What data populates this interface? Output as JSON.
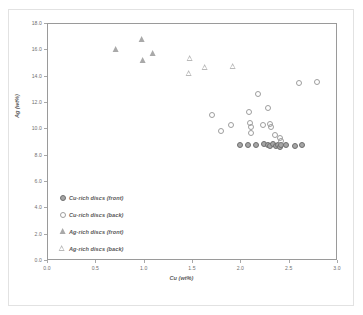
{
  "chart_data": {
    "type": "scatter",
    "title": "",
    "xlabel": "Cu (wt%)",
    "ylabel": "Ag (wt%)",
    "xlim": [
      0.0,
      3.0
    ],
    "ylim": [
      0.0,
      18.0
    ],
    "xticks": [
      "0.0",
      "0.5",
      "1.0",
      "1.5",
      "2.0",
      "2.5",
      "3.0"
    ],
    "yticks": [
      "0.0",
      "2.0",
      "4.0",
      "6.0",
      "8.0",
      "10.0",
      "12.0",
      "14.0",
      "16.0",
      "18.0"
    ],
    "grid": false,
    "legend_position": "inside-lower-left",
    "marker_color_filled": "#a6a6a6",
    "marker_color_outline": "#6e6e6e",
    "marker_color_open": "#9e9e9e",
    "series": [
      {
        "name": "Cu-rich discs (front)",
        "marker": "filled-circle",
        "points": [
          [
            1.99,
            8.83
          ],
          [
            2.07,
            8.83
          ],
          [
            2.15,
            8.83
          ],
          [
            2.23,
            8.87
          ],
          [
            2.28,
            8.83
          ],
          [
            2.3,
            8.7
          ],
          [
            2.33,
            8.87
          ],
          [
            2.36,
            8.72
          ],
          [
            2.38,
            8.83
          ],
          [
            2.4,
            8.65
          ],
          [
            2.41,
            8.8
          ],
          [
            2.46,
            8.78
          ],
          [
            2.55,
            8.7
          ],
          [
            2.63,
            8.83
          ]
        ]
      },
      {
        "name": "Cu-rich discs (back)",
        "marker": "open-circle",
        "points": [
          [
            1.7,
            11.1
          ],
          [
            1.79,
            9.85
          ],
          [
            1.89,
            10.35
          ],
          [
            2.08,
            11.35
          ],
          [
            2.09,
            10.45
          ],
          [
            2.1,
            10.2
          ],
          [
            2.1,
            9.75
          ],
          [
            2.17,
            12.7
          ],
          [
            2.22,
            10.35
          ],
          [
            2.28,
            11.6
          ],
          [
            2.3,
            10.4
          ],
          [
            2.31,
            10.2
          ],
          [
            2.35,
            9.55
          ],
          [
            2.4,
            9.35
          ],
          [
            2.41,
            9.15
          ],
          [
            2.6,
            13.5
          ],
          [
            2.78,
            13.6
          ]
        ]
      },
      {
        "name": "Ag-rich discs (front)",
        "marker": "filled-triangle",
        "points": [
          [
            0.7,
            16.05
          ],
          [
            0.97,
            16.75
          ],
          [
            0.98,
            15.2
          ],
          [
            1.09,
            15.7
          ]
        ]
      },
      {
        "name": "Ag-rich discs (back)",
        "marker": "open-triangle",
        "points": [
          [
            1.47,
            15.35
          ],
          [
            1.46,
            14.2
          ],
          [
            1.63,
            14.65
          ],
          [
            1.92,
            14.75
          ]
        ]
      }
    ]
  },
  "legend": {
    "items": [
      {
        "label": "Cu-rich discs (front)",
        "marker": "filled-circle"
      },
      {
        "label": "Cu-rich discs (back)",
        "marker": "open-circle"
      },
      {
        "label": "Ag-rich discs (front)",
        "marker": "filled-triangle"
      },
      {
        "label": "Ag-rich discs (back)",
        "marker": "open-triangle"
      }
    ]
  }
}
